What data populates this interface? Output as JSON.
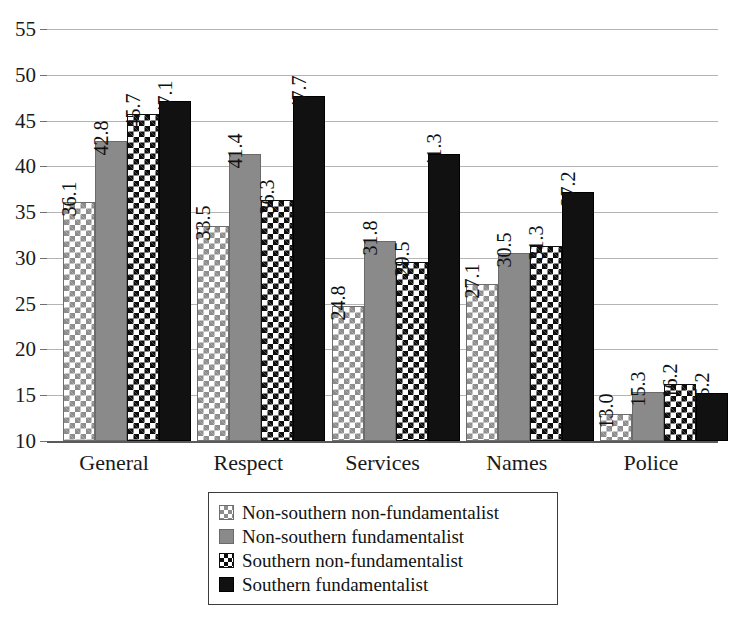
{
  "chart_data": {
    "type": "bar",
    "title": "",
    "xlabel": "",
    "ylabel": "",
    "categories": [
      "General",
      "Respect",
      "Services",
      "Names",
      "Police"
    ],
    "ylim": [
      10,
      55
    ],
    "yticks": [
      10,
      15,
      20,
      25,
      30,
      35,
      40,
      45,
      50,
      55
    ],
    "ytick_labels": [
      "10",
      "15",
      "20",
      "25",
      "30",
      "35",
      "40",
      "45",
      "50",
      "55"
    ],
    "grid": true,
    "legend_position": "bottom",
    "data_labels": true,
    "series": [
      {
        "name": "Non-southern non-fundamentalist",
        "pattern": "light-diamond-lattice",
        "values": [
          36.1,
          33.5,
          24.8,
          27.1,
          13.0
        ],
        "labels": [
          "36.1",
          "33.5",
          "24.8",
          "27.1",
          "13.0"
        ]
      },
      {
        "name": "Non-southern fundamentalist",
        "pattern": "solid-gray",
        "color": "#8a8a8a",
        "values": [
          42.8,
          41.4,
          31.8,
          30.5,
          15.3
        ],
        "labels": [
          "42.8",
          "41.4",
          "31.8",
          "30.5",
          "15.3"
        ]
      },
      {
        "name": "Southern non-fundamentalist",
        "pattern": "dark-diamond-lattice",
        "values": [
          45.7,
          36.3,
          29.5,
          31.3,
          16.2
        ],
        "labels": [
          "45.7",
          "36.3",
          "29.5",
          "31.3",
          "16.2"
        ]
      },
      {
        "name": "Southern fundamentalist",
        "pattern": "solid-black",
        "color": "#111111",
        "values": [
          47.1,
          47.7,
          41.3,
          37.2,
          15.2
        ],
        "labels": [
          "47.1",
          "47.7",
          "41.3",
          "37.2",
          "15.2"
        ]
      }
    ]
  },
  "legend": {
    "items": [
      {
        "label": "Non-southern non-fundamentalist",
        "swatch": "light-diamond-lattice"
      },
      {
        "label": "Non-southern fundamentalist",
        "swatch": "solid-gray"
      },
      {
        "label": "Southern non-fundamentalist",
        "swatch": "dark-diamond-lattice"
      },
      {
        "label": "Southern fundamentalist",
        "swatch": "solid-black"
      }
    ]
  }
}
